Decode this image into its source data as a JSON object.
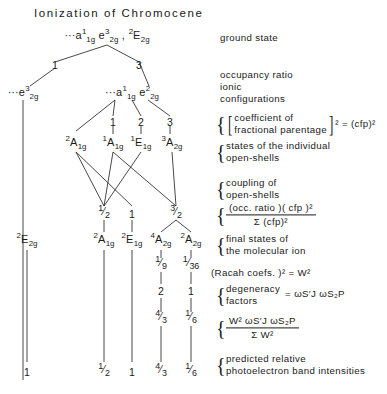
{
  "title": "Ionization of Chromocene",
  "diagram": {
    "type": "branching-tree",
    "nodes": [
      {
        "id": "ground",
        "label": "···a¹₁g e³₂g , ²E₂g",
        "html": "<span class='pre'>···</span>a<sup>1</sup><sub>1g</sub> e<sup>3</sup><sub>2g</sub> , <sup>2</sup>E<sub>2g</sub>",
        "x": 107,
        "y": 36
      },
      {
        "id": "ion-left",
        "label": "···e³₂g",
        "html": "<span class='pre'>···</span>e<sup>3</sup><sub>2g</sub>",
        "x": 23,
        "y": 93
      },
      {
        "id": "ion-right",
        "label": "···a¹₁g e²₂g",
        "html": "<span class='pre'>···</span>a<sup>1</sup><sub>1g</sub> e<sup>2</sup><sub>2g</sub>",
        "x": 132,
        "y": 93
      },
      {
        "id": "os-0",
        "label": "²A₁g",
        "html": "<sup>2</sup>A<sub>1g</sub>",
        "x": 76,
        "y": 143
      },
      {
        "id": "os-1",
        "label": "¹A₁g",
        "html": "<sup>1</sup>A<sub>1g</sub>",
        "x": 113,
        "y": 143
      },
      {
        "id": "os-2",
        "label": "¹E₁g",
        "html": "<sup>1</sup>E<sub>1g</sub>",
        "x": 141,
        "y": 143
      },
      {
        "id": "os-3",
        "label": "³A₂g",
        "html": "<sup>3</sup>A<sub>2g</sub>",
        "x": 172,
        "y": 143
      },
      {
        "id": "fs-0",
        "label": "²E₂g",
        "html": "<sup>2</sup>E<sub>2g</sub>",
        "x": 27,
        "y": 240
      },
      {
        "id": "fs-1",
        "label": "²A₁g",
        "html": "<sup>2</sup>A<sub>1g</sub>",
        "x": 104,
        "y": 240
      },
      {
        "id": "fs-2",
        "label": "²E₁g",
        "html": "<sup>2</sup>E<sub>1g</sub>",
        "x": 132,
        "y": 240
      },
      {
        "id": "fs-3",
        "label": "⁴A₂g",
        "html": "<sup>4</sup>A<sub>2g</sub>",
        "x": 161,
        "y": 240
      },
      {
        "id": "fs-4",
        "label": "²A₂g",
        "html": "<sup>2</sup>A<sub>2g</sub>",
        "x": 191,
        "y": 240
      }
    ],
    "numbers": [
      {
        "id": "occ-left",
        "label": "1",
        "x": 55,
        "y": 65
      },
      {
        "id": "occ-right",
        "label": "3",
        "x": 139,
        "y": 65
      },
      {
        "id": "cfp-1",
        "label": "1",
        "x": 113,
        "y": 122
      },
      {
        "id": "cfp-2",
        "label": "2",
        "x": 141,
        "y": 122
      },
      {
        "id": "cfp-3",
        "label": "3",
        "x": 170,
        "y": 122
      },
      {
        "id": "coup-1",
        "label": "1/2",
        "n": "1",
        "d": "2",
        "x": 104,
        "y": 214
      },
      {
        "id": "coup-2",
        "label": "1",
        "n": "1",
        "d": "",
        "x": 132,
        "y": 214
      },
      {
        "id": "coup-3",
        "label": "3/2",
        "n": "3",
        "d": "2",
        "x": 176,
        "y": 214
      },
      {
        "id": "racah-3",
        "label": "1/9",
        "n": "1",
        "d": "9",
        "x": 161,
        "y": 265
      },
      {
        "id": "racah-4",
        "label": "1/36",
        "n": "1",
        "d": "36",
        "x": 191,
        "y": 265
      },
      {
        "id": "deg-3",
        "label": "2",
        "x": 161,
        "y": 291
      },
      {
        "id": "deg-4",
        "label": "1",
        "x": 191,
        "y": 291
      },
      {
        "id": "int-3",
        "label": "4/3",
        "n": "4",
        "d": "3",
        "x": 161,
        "y": 319
      },
      {
        "id": "int-4",
        "label": "1/6",
        "n": "1",
        "d": "6",
        "x": 191,
        "y": 319
      },
      {
        "id": "res-0",
        "label": "1",
        "x": 27,
        "y": 372
      },
      {
        "id": "res-1",
        "label": "1/2",
        "n": "1",
        "d": "2",
        "x": 104,
        "y": 372
      },
      {
        "id": "res-2",
        "label": "1",
        "x": 132,
        "y": 372
      },
      {
        "id": "res-3",
        "label": "4/3",
        "n": "4",
        "d": "3",
        "x": 161,
        "y": 372
      },
      {
        "id": "res-4",
        "label": "1/6",
        "n": "1",
        "d": "6",
        "x": 191,
        "y": 372
      }
    ]
  },
  "annotations": [
    {
      "id": "ground-state",
      "line1": "ground state",
      "line2": "",
      "brace": false,
      "x": 220,
      "y": 37
    },
    {
      "id": "occupancy-ratio",
      "line1": "occupancy ratio",
      "line2": "",
      "brace": false,
      "x": 220,
      "y": 74
    },
    {
      "id": "ionic-configurations",
      "line1": "ionic",
      "line2": "configurations",
      "brace": false,
      "x": 220,
      "y": 93
    },
    {
      "id": "cfp-squared",
      "line1": "coefficient of",
      "line2": "fractional parentage",
      "suffix": "² = (cfp)²",
      "brace": true,
      "x": 216,
      "y": 124
    },
    {
      "id": "states-open-shells",
      "line1": "states of the individual",
      "line2": "open-shells",
      "brace": true,
      "x": 216,
      "y": 152
    },
    {
      "id": "coupling-open-shells",
      "line1": "coupling of",
      "line2": "open-shells",
      "brace": true,
      "x": 216,
      "y": 189
    },
    {
      "id": "occ-ratio-formula",
      "line1": "(occ. ratio )( cfp )²",
      "line2": "Σ (cfp)²",
      "brace": true,
      "x": 216,
      "y": 215
    },
    {
      "id": "final-states",
      "line1": "final states of",
      "line2": "the molecular ion",
      "brace": true,
      "x": 216,
      "y": 245
    },
    {
      "id": "racah-coefs",
      "line1": "(Racah coefs. )² = W²",
      "line2": "",
      "brace": false,
      "x": 211,
      "y": 272
    },
    {
      "id": "degeneracy-factors",
      "line1": "degeneracy",
      "line2": "factors",
      "suffix": "= ωS′J ωS₂P",
      "brace": true,
      "x": 216,
      "y": 295
    },
    {
      "id": "intensity-formula",
      "line1": "W² ωS′J ωS₂P",
      "line2": "Σ W²",
      "brace": true,
      "x": 216,
      "y": 328
    },
    {
      "id": "predicted-intensities",
      "line1": "predicted relative",
      "line2": "photoelectron band intensities",
      "brace": true,
      "x": 216,
      "y": 365
    }
  ],
  "edges": [
    [
      107,
      45,
      55,
      62
    ],
    [
      55,
      68,
      30,
      86
    ],
    [
      107,
      45,
      139,
      62
    ],
    [
      139,
      62,
      149,
      86
    ],
    [
      23,
      100,
      23,
      380
    ],
    [
      115,
      100,
      76,
      131
    ],
    [
      115,
      100,
      113,
      116
    ],
    [
      132,
      100,
      141,
      116
    ],
    [
      148,
      100,
      170,
      116
    ],
    [
      113,
      126,
      113,
      134
    ],
    [
      141,
      126,
      141,
      134
    ],
    [
      170,
      126,
      170,
      134
    ],
    [
      76,
      152,
      104,
      206
    ],
    [
      76,
      152,
      132,
      206
    ],
    [
      113,
      152,
      104,
      206
    ],
    [
      113,
      152,
      176,
      206
    ],
    [
      141,
      152,
      104,
      206
    ],
    [
      172,
      152,
      176,
      206
    ],
    [
      104,
      220,
      104,
      232
    ],
    [
      132,
      220,
      132,
      232
    ],
    [
      176,
      220,
      161,
      232
    ],
    [
      176,
      220,
      191,
      232
    ],
    [
      27,
      250,
      27,
      362
    ],
    [
      104,
      250,
      104,
      362
    ],
    [
      132,
      250,
      132,
      362
    ],
    [
      161,
      250,
      161,
      258
    ],
    [
      191,
      250,
      191,
      258
    ],
    [
      161,
      272,
      161,
      284
    ],
    [
      191,
      272,
      191,
      284
    ],
    [
      161,
      298,
      161,
      312
    ],
    [
      191,
      298,
      191,
      312
    ],
    [
      161,
      326,
      161,
      362
    ],
    [
      191,
      326,
      191,
      362
    ]
  ],
  "style": {
    "ink": "#1a1a1a",
    "background": "#ffffff"
  }
}
